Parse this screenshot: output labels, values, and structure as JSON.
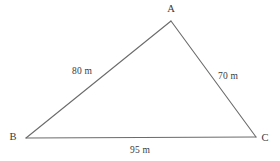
{
  "figure": {
    "type": "triangle-diagram",
    "background_color": "#ffffff",
    "stroke_color": "#6b6b6b",
    "text_color": "#3a3a3a",
    "width": 280,
    "height": 161,
    "vertices": [
      {
        "name": "A",
        "label": "A",
        "x": 171,
        "y": 21,
        "label_x": 171,
        "label_y": 9
      },
      {
        "name": "B",
        "label": "B",
        "x": 26,
        "y": 138,
        "label_x": 13,
        "label_y": 137
      },
      {
        "name": "C",
        "label": "C",
        "x": 256,
        "y": 137,
        "label_x": 265,
        "label_y": 138
      }
    ],
    "sides": [
      {
        "name": "AB",
        "from": "A",
        "to": "B",
        "label": "80 m",
        "value": 80,
        "unit": "m",
        "label_x": 82,
        "label_y": 72
      },
      {
        "name": "AC",
        "from": "A",
        "to": "C",
        "label": "70 m",
        "value": 70,
        "unit": "m",
        "label_x": 228,
        "label_y": 77
      },
      {
        "name": "BC",
        "from": "B",
        "to": "C",
        "label": "95 m",
        "value": 95,
        "unit": "m",
        "label_x": 140,
        "label_y": 151
      }
    ]
  }
}
